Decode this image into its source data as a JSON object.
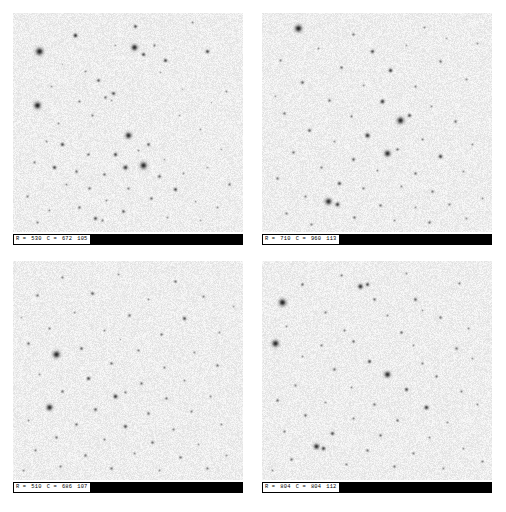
{
  "viewer": {
    "name": "star-field-cutout-grid",
    "background_color": "#ffffff",
    "sky_background_color": "#ededed",
    "star_color": "#1a1a1a",
    "statusbar_color": "#000000",
    "readout_text_color": "#000000",
    "rows": 2,
    "columns": 2
  },
  "panels": [
    {
      "id": "panel-top-left",
      "readout": {
        "row_label": "R =",
        "row_value": "530",
        "col_label": "C =",
        "col_value": "672",
        "extra_value": "105",
        "full_text": "R = 530   C = 672   105"
      }
    },
    {
      "id": "panel-top-right",
      "readout": {
        "row_label": "R =",
        "row_value": "710",
        "col_label": "C =",
        "col_value": "960",
        "extra_value": "113",
        "full_text": "R = 710   C = 960   113"
      }
    },
    {
      "id": "panel-bottom-left",
      "readout": {
        "row_label": "R =",
        "row_value": "510",
        "col_label": "C =",
        "col_value": "686",
        "extra_value": "107",
        "full_text": "R = 510   C = 686   107"
      }
    },
    {
      "id": "panel-bottom-right",
      "readout": {
        "row_label": "R =",
        "row_value": "804",
        "col_label": "C =",
        "col_value": "804",
        "extra_value": "112",
        "full_text": "R = 804   C = 804   112"
      }
    }
  ],
  "star_fields": {
    "note": "Normalized (x,y,r,darkness) star positions per panel, read off the rendered cutouts.",
    "panel0": [
      [
        0.27,
        0.1,
        1.3,
        0.85
      ],
      [
        0.53,
        0.06,
        1.1,
        0.7
      ],
      [
        0.78,
        0.04,
        0.8,
        0.45
      ],
      [
        0.115,
        0.175,
        2.4,
        0.95
      ],
      [
        0.525,
        0.155,
        2.0,
        0.92
      ],
      [
        0.565,
        0.185,
        1.2,
        0.72
      ],
      [
        0.615,
        0.145,
        0.9,
        0.5
      ],
      [
        0.66,
        0.215,
        1.2,
        0.75
      ],
      [
        0.445,
        0.145,
        0.7,
        0.35
      ],
      [
        0.845,
        0.175,
        1.2,
        0.75
      ],
      [
        0.315,
        0.265,
        0.8,
        0.42
      ],
      [
        0.64,
        0.27,
        0.7,
        0.33
      ],
      [
        0.165,
        0.335,
        0.7,
        0.38
      ],
      [
        0.37,
        0.305,
        1.1,
        0.62
      ],
      [
        0.105,
        0.42,
        2.2,
        0.95
      ],
      [
        0.285,
        0.4,
        0.9,
        0.48
      ],
      [
        0.4,
        0.385,
        1.0,
        0.55
      ],
      [
        0.425,
        0.395,
        0.7,
        0.33
      ],
      [
        0.435,
        0.365,
        1.2,
        0.7
      ],
      [
        0.735,
        0.345,
        0.6,
        0.3
      ],
      [
        0.345,
        0.465,
        0.9,
        0.46
      ],
      [
        0.195,
        0.5,
        0.8,
        0.4
      ],
      [
        0.5,
        0.555,
        2.0,
        0.9
      ],
      [
        0.815,
        0.53,
        0.7,
        0.35
      ],
      [
        0.145,
        0.585,
        0.8,
        0.42
      ],
      [
        0.215,
        0.6,
        1.2,
        0.72
      ],
      [
        0.545,
        0.625,
        0.8,
        0.4
      ],
      [
        0.585,
        0.6,
        1.1,
        0.62
      ],
      [
        0.325,
        0.645,
        1.0,
        0.55
      ],
      [
        0.445,
        0.645,
        1.2,
        0.74
      ],
      [
        0.09,
        0.68,
        0.9,
        0.48
      ],
      [
        0.655,
        0.665,
        0.7,
        0.33
      ],
      [
        0.18,
        0.705,
        1.2,
        0.75
      ],
      [
        0.275,
        0.72,
        1.0,
        0.56
      ],
      [
        0.565,
        0.695,
        2.2,
        0.92
      ],
      [
        0.485,
        0.705,
        1.5,
        0.8
      ],
      [
        0.395,
        0.735,
        1.0,
        0.55
      ],
      [
        0.635,
        0.745,
        1.1,
        0.6
      ],
      [
        0.74,
        0.73,
        0.8,
        0.4
      ],
      [
        0.845,
        0.705,
        0.7,
        0.33
      ],
      [
        0.23,
        0.78,
        0.8,
        0.42
      ],
      [
        0.33,
        0.8,
        1.0,
        0.52
      ],
      [
        0.5,
        0.8,
        0.9,
        0.48
      ],
      [
        0.705,
        0.805,
        1.2,
        0.72
      ],
      [
        0.06,
        0.835,
        0.9,
        0.46
      ],
      [
        0.405,
        0.855,
        0.8,
        0.4
      ],
      [
        0.6,
        0.845,
        1.0,
        0.55
      ],
      [
        0.79,
        0.86,
        0.7,
        0.35
      ],
      [
        0.285,
        0.885,
        1.0,
        0.54
      ],
      [
        0.155,
        0.9,
        0.8,
        0.42
      ],
      [
        0.48,
        0.905,
        1.1,
        0.62
      ],
      [
        0.885,
        0.885,
        0.8,
        0.42
      ],
      [
        0.355,
        0.935,
        1.2,
        0.7
      ],
      [
        0.385,
        0.945,
        0.9,
        0.48
      ],
      [
        0.67,
        0.93,
        0.8,
        0.4
      ],
      [
        0.815,
        0.945,
        0.7,
        0.35
      ],
      [
        0.105,
        0.955,
        0.9,
        0.46
      ],
      [
        0.925,
        0.355,
        0.8,
        0.4
      ],
      [
        0.905,
        0.62,
        0.7,
        0.33
      ],
      [
        0.94,
        0.78,
        1.0,
        0.52
      ],
      [
        0.215,
        0.235,
        0.6,
        0.28
      ],
      [
        0.72,
        0.465,
        0.7,
        0.33
      ],
      [
        0.86,
        0.405,
        0.6,
        0.28
      ]
    ],
    "panel1": [
      [
        0.155,
        0.07,
        2.3,
        0.95
      ],
      [
        0.395,
        0.095,
        1.0,
        0.52
      ],
      [
        0.705,
        0.065,
        0.8,
        0.4
      ],
      [
        0.245,
        0.16,
        0.8,
        0.42
      ],
      [
        0.48,
        0.175,
        1.2,
        0.72
      ],
      [
        0.625,
        0.145,
        0.7,
        0.35
      ],
      [
        0.08,
        0.215,
        0.9,
        0.48
      ],
      [
        0.345,
        0.245,
        1.0,
        0.55
      ],
      [
        0.555,
        0.26,
        1.3,
        0.78
      ],
      [
        0.775,
        0.22,
        1.0,
        0.54
      ],
      [
        0.175,
        0.315,
        1.1,
        0.62
      ],
      [
        0.44,
        0.33,
        0.8,
        0.4
      ],
      [
        0.665,
        0.335,
        0.9,
        0.46
      ],
      [
        0.885,
        0.3,
        0.8,
        0.42
      ],
      [
        0.29,
        0.395,
        1.0,
        0.55
      ],
      [
        0.52,
        0.4,
        1.4,
        0.8
      ],
      [
        0.735,
        0.425,
        0.8,
        0.42
      ],
      [
        0.095,
        0.455,
        1.0,
        0.52
      ],
      [
        0.385,
        0.47,
        0.9,
        0.48
      ],
      [
        0.6,
        0.49,
        2.2,
        0.92
      ],
      [
        0.64,
        0.465,
        1.2,
        0.7
      ],
      [
        0.84,
        0.495,
        1.0,
        0.55
      ],
      [
        0.205,
        0.535,
        1.1,
        0.62
      ],
      [
        0.455,
        0.555,
        1.5,
        0.82
      ],
      [
        0.315,
        0.585,
        0.8,
        0.42
      ],
      [
        0.695,
        0.575,
        0.9,
        0.48
      ],
      [
        0.915,
        0.6,
        0.8,
        0.4
      ],
      [
        0.135,
        0.635,
        1.0,
        0.54
      ],
      [
        0.545,
        0.64,
        2.0,
        0.9
      ],
      [
        0.585,
        0.62,
        1.0,
        0.55
      ],
      [
        0.395,
        0.665,
        1.1,
        0.6
      ],
      [
        0.775,
        0.655,
        1.3,
        0.76
      ],
      [
        0.255,
        0.705,
        0.9,
        0.48
      ],
      [
        0.5,
        0.715,
        0.8,
        0.42
      ],
      [
        0.665,
        0.73,
        1.0,
        0.55
      ],
      [
        0.875,
        0.72,
        0.8,
        0.4
      ],
      [
        0.065,
        0.755,
        1.0,
        0.52
      ],
      [
        0.335,
        0.775,
        1.2,
        0.7
      ],
      [
        0.44,
        0.8,
        0.9,
        0.48
      ],
      [
        0.605,
        0.79,
        0.8,
        0.42
      ],
      [
        0.74,
        0.815,
        1.0,
        0.55
      ],
      [
        0.185,
        0.835,
        0.9,
        0.46
      ],
      [
        0.285,
        0.86,
        2.1,
        0.9
      ],
      [
        0.325,
        0.87,
        1.4,
        0.78
      ],
      [
        0.515,
        0.875,
        1.0,
        0.54
      ],
      [
        0.665,
        0.885,
        0.8,
        0.4
      ],
      [
        0.815,
        0.87,
        0.9,
        0.46
      ],
      [
        0.955,
        0.845,
        0.8,
        0.4
      ],
      [
        0.105,
        0.915,
        0.9,
        0.48
      ],
      [
        0.4,
        0.93,
        1.0,
        0.52
      ],
      [
        0.575,
        0.945,
        0.8,
        0.42
      ],
      [
        0.725,
        0.955,
        1.0,
        0.55
      ],
      [
        0.885,
        0.935,
        0.8,
        0.4
      ],
      [
        0.215,
        0.965,
        0.9,
        0.46
      ],
      [
        0.935,
        0.135,
        0.8,
        0.4
      ],
      [
        0.055,
        0.38,
        0.7,
        0.35
      ],
      [
        0.8,
        0.115,
        0.7,
        0.33
      ]
    ],
    "panel2": [
      [
        0.215,
        0.075,
        0.9,
        0.48
      ],
      [
        0.455,
        0.06,
        0.8,
        0.4
      ],
      [
        0.705,
        0.09,
        1.0,
        0.54
      ],
      [
        0.105,
        0.155,
        1.0,
        0.52
      ],
      [
        0.345,
        0.145,
        1.1,
        0.62
      ],
      [
        0.585,
        0.175,
        0.8,
        0.42
      ],
      [
        0.825,
        0.16,
        0.9,
        0.46
      ],
      [
        0.265,
        0.235,
        0.8,
        0.4
      ],
      [
        0.505,
        0.245,
        1.0,
        0.55
      ],
      [
        0.745,
        0.26,
        1.2,
        0.7
      ],
      [
        0.155,
        0.305,
        0.9,
        0.48
      ],
      [
        0.395,
        0.315,
        0.8,
        0.42
      ],
      [
        0.645,
        0.335,
        1.0,
        0.52
      ],
      [
        0.895,
        0.325,
        0.8,
        0.4
      ],
      [
        0.065,
        0.375,
        1.0,
        0.55
      ],
      [
        0.295,
        0.395,
        1.1,
        0.6
      ],
      [
        0.185,
        0.425,
        2.2,
        0.93
      ],
      [
        0.545,
        0.405,
        0.9,
        0.48
      ],
      [
        0.785,
        0.415,
        0.8,
        0.42
      ],
      [
        0.425,
        0.465,
        1.0,
        0.54
      ],
      [
        0.655,
        0.485,
        0.9,
        0.46
      ],
      [
        0.885,
        0.475,
        1.0,
        0.52
      ],
      [
        0.115,
        0.515,
        0.8,
        0.42
      ],
      [
        0.325,
        0.535,
        1.2,
        0.72
      ],
      [
        0.555,
        0.555,
        1.0,
        0.55
      ],
      [
        0.745,
        0.545,
        0.8,
        0.4
      ],
      [
        0.215,
        0.595,
        1.0,
        0.54
      ],
      [
        0.445,
        0.615,
        1.4,
        0.8
      ],
      [
        0.485,
        0.6,
        0.9,
        0.48
      ],
      [
        0.665,
        0.625,
        1.0,
        0.52
      ],
      [
        0.855,
        0.615,
        0.8,
        0.42
      ],
      [
        0.155,
        0.665,
        2.0,
        0.9
      ],
      [
        0.355,
        0.675,
        1.1,
        0.62
      ],
      [
        0.585,
        0.695,
        1.0,
        0.55
      ],
      [
        0.775,
        0.685,
        0.9,
        0.46
      ],
      [
        0.065,
        0.725,
        0.8,
        0.4
      ],
      [
        0.275,
        0.745,
        1.0,
        0.54
      ],
      [
        0.485,
        0.755,
        1.2,
        0.7
      ],
      [
        0.695,
        0.765,
        0.9,
        0.48
      ],
      [
        0.905,
        0.745,
        0.8,
        0.42
      ],
      [
        0.185,
        0.805,
        1.0,
        0.52
      ],
      [
        0.395,
        0.815,
        0.9,
        0.46
      ],
      [
        0.605,
        0.825,
        1.0,
        0.55
      ],
      [
        0.805,
        0.835,
        0.8,
        0.4
      ],
      [
        0.095,
        0.865,
        0.9,
        0.48
      ],
      [
        0.315,
        0.885,
        1.0,
        0.52
      ],
      [
        0.525,
        0.875,
        0.8,
        0.42
      ],
      [
        0.725,
        0.895,
        1.0,
        0.54
      ],
      [
        0.925,
        0.885,
        0.8,
        0.4
      ],
      [
        0.205,
        0.935,
        0.9,
        0.46
      ],
      [
        0.425,
        0.945,
        1.0,
        0.52
      ],
      [
        0.635,
        0.955,
        0.8,
        0.42
      ],
      [
        0.845,
        0.945,
        0.9,
        0.48
      ],
      [
        0.045,
        0.955,
        0.8,
        0.4
      ],
      [
        0.955,
        0.205,
        0.7,
        0.35
      ],
      [
        0.035,
        0.255,
        0.7,
        0.33
      ],
      [
        0.465,
        0.355,
        0.6,
        0.3
      ]
    ],
    "panel3": [
      [
        0.345,
        0.065,
        0.9,
        0.48
      ],
      [
        0.625,
        0.055,
        0.8,
        0.4
      ],
      [
        0.175,
        0.105,
        1.0,
        0.54
      ],
      [
        0.425,
        0.115,
        1.6,
        0.85
      ],
      [
        0.455,
        0.105,
        1.2,
        0.72
      ],
      [
        0.855,
        0.1,
        0.9,
        0.46
      ],
      [
        0.085,
        0.185,
        2.3,
        0.95
      ],
      [
        0.485,
        0.175,
        1.0,
        0.55
      ],
      [
        0.665,
        0.175,
        1.1,
        0.62
      ],
      [
        0.275,
        0.235,
        0.9,
        0.48
      ],
      [
        0.545,
        0.245,
        0.8,
        0.42
      ],
      [
        0.775,
        0.255,
        1.0,
        0.52
      ],
      [
        0.105,
        0.295,
        0.8,
        0.4
      ],
      [
        0.355,
        0.315,
        0.9,
        0.46
      ],
      [
        0.605,
        0.325,
        1.0,
        0.55
      ],
      [
        0.895,
        0.305,
        0.8,
        0.42
      ],
      [
        0.055,
        0.375,
        2.2,
        0.93
      ],
      [
        0.255,
        0.385,
        0.9,
        0.48
      ],
      [
        0.395,
        0.365,
        1.0,
        0.52
      ],
      [
        0.655,
        0.385,
        0.8,
        0.4
      ],
      [
        0.845,
        0.395,
        1.0,
        0.54
      ],
      [
        0.175,
        0.435,
        0.8,
        0.42
      ],
      [
        0.465,
        0.455,
        1.2,
        0.7
      ],
      [
        0.695,
        0.465,
        0.9,
        0.48
      ],
      [
        0.915,
        0.445,
        0.8,
        0.4
      ],
      [
        0.315,
        0.495,
        1.0,
        0.55
      ],
      [
        0.545,
        0.515,
        2.0,
        0.9
      ],
      [
        0.755,
        0.525,
        1.0,
        0.52
      ],
      [
        0.145,
        0.565,
        0.9,
        0.46
      ],
      [
        0.385,
        0.575,
        0.8,
        0.42
      ],
      [
        0.625,
        0.585,
        1.2,
        0.72
      ],
      [
        0.865,
        0.595,
        0.9,
        0.48
      ],
      [
        0.065,
        0.635,
        1.0,
        0.54
      ],
      [
        0.275,
        0.645,
        0.8,
        0.4
      ],
      [
        0.485,
        0.655,
        1.0,
        0.52
      ],
      [
        0.715,
        0.665,
        1.4,
        0.8
      ],
      [
        0.935,
        0.655,
        0.8,
        0.42
      ],
      [
        0.185,
        0.705,
        1.0,
        0.55
      ],
      [
        0.395,
        0.715,
        0.9,
        0.46
      ],
      [
        0.585,
        0.725,
        1.0,
        0.52
      ],
      [
        0.805,
        0.735,
        0.8,
        0.4
      ],
      [
        0.095,
        0.775,
        0.9,
        0.48
      ],
      [
        0.305,
        0.785,
        1.2,
        0.7
      ],
      [
        0.515,
        0.795,
        1.0,
        0.54
      ],
      [
        0.725,
        0.805,
        0.8,
        0.42
      ],
      [
        0.235,
        0.845,
        1.8,
        0.88
      ],
      [
        0.265,
        0.855,
        1.3,
        0.76
      ],
      [
        0.455,
        0.865,
        1.0,
        0.52
      ],
      [
        0.655,
        0.875,
        0.9,
        0.48
      ],
      [
        0.875,
        0.855,
        0.8,
        0.4
      ],
      [
        0.125,
        0.905,
        1.0,
        0.54
      ],
      [
        0.365,
        0.925,
        0.9,
        0.46
      ],
      [
        0.575,
        0.935,
        1.0,
        0.52
      ],
      [
        0.785,
        0.945,
        0.8,
        0.42
      ],
      [
        0.955,
        0.915,
        0.9,
        0.48
      ],
      [
        0.045,
        0.955,
        0.8,
        0.4
      ],
      [
        0.695,
        0.225,
        0.7,
        0.35
      ]
    ]
  }
}
